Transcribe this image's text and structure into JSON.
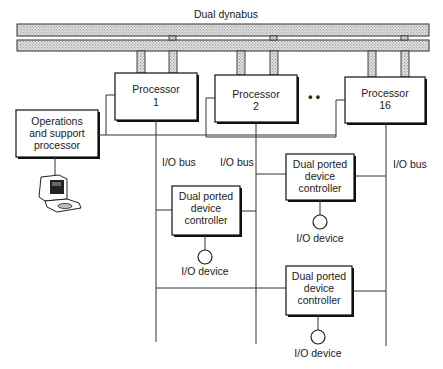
{
  "title": "Dual dynabus",
  "processors": [
    {
      "label_line1": "Processor",
      "label_line2": "1"
    },
    {
      "label_line1": "Processor",
      "label_line2": "2"
    },
    {
      "label_line1": "Processor",
      "label_line2": "16"
    }
  ],
  "ellipsis": "• •",
  "ops_processor": {
    "line1": "Operations",
    "line2": "and support",
    "line3": "processor"
  },
  "io_bus_labels": [
    "I/O bus",
    "I/O bus",
    "I/O bus"
  ],
  "controllers": [
    {
      "line1": "Dual ported",
      "line2": "device",
      "line3": "controller",
      "device_label": "I/O device"
    },
    {
      "line1": "Dual ported",
      "line2": "device",
      "line3": "controller",
      "device_label": "I/O device"
    },
    {
      "line1": "Dual ported",
      "line2": "device",
      "line3": "controller",
      "device_label": "I/O device"
    }
  ],
  "terminal": {
    "icon": "computer-terminal-icon"
  }
}
